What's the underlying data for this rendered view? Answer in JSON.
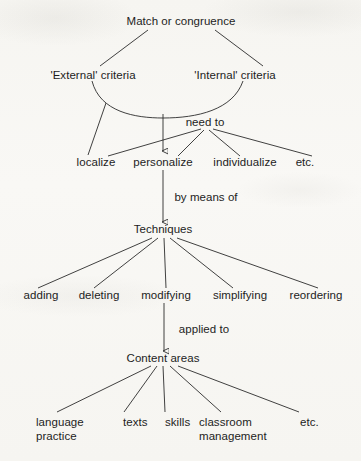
{
  "diagram": {
    "title": "Match or congruence",
    "type": "hierarchy-tree",
    "ink_color": "#2b2b2b",
    "paper_color": "#f6f5f1",
    "levels": [
      {
        "level": 1,
        "name": "root",
        "nodes": [
          {
            "id": "root",
            "label": "Match or congruence",
            "x": 181,
            "y": 22
          }
        ]
      },
      {
        "level": 2,
        "name": "criteria",
        "nodes": [
          {
            "id": "external",
            "label": "'External' criteria",
            "x": 93,
            "y": 76
          },
          {
            "id": "internal",
            "label": "'Internal' criteria",
            "x": 235,
            "y": 76
          }
        ]
      },
      {
        "level": 3,
        "name": "connector-need-to",
        "nodes": [
          {
            "id": "needto",
            "label": "need to",
            "x": 205,
            "y": 123
          }
        ]
      },
      {
        "level": 4,
        "name": "actions",
        "nodes": [
          {
            "id": "localize",
            "label": "localize",
            "x": 96,
            "y": 163
          },
          {
            "id": "personalize",
            "label": "personalize",
            "x": 163,
            "y": 163
          },
          {
            "id": "individualize",
            "label": "individualize",
            "x": 245,
            "y": 163
          },
          {
            "id": "etc-actions",
            "label": "etc.",
            "x": 305,
            "y": 163
          }
        ]
      },
      {
        "level": 5,
        "name": "connector-by-means-of",
        "nodes": [
          {
            "id": "bymeansof",
            "label": "by means of",
            "x": 206,
            "y": 198
          }
        ]
      },
      {
        "level": 6,
        "name": "techniques",
        "nodes": [
          {
            "id": "techniques",
            "label": "Techniques",
            "x": 163,
            "y": 230
          }
        ]
      },
      {
        "level": 7,
        "name": "technique-items",
        "nodes": [
          {
            "id": "adding",
            "label": "adding",
            "x": 41,
            "y": 296
          },
          {
            "id": "deleting",
            "label": "deleting",
            "x": 99,
            "y": 296
          },
          {
            "id": "modifying",
            "label": "modifying",
            "x": 166,
            "y": 296
          },
          {
            "id": "simplifying",
            "label": "simplifying",
            "x": 240,
            "y": 296
          },
          {
            "id": "reordering",
            "label": "reordering",
            "x": 316,
            "y": 296
          }
        ]
      },
      {
        "level": 8,
        "name": "connector-applied-to",
        "nodes": [
          {
            "id": "appliedto",
            "label": "applied to",
            "x": 204,
            "y": 330
          }
        ]
      },
      {
        "level": 9,
        "name": "content-areas",
        "nodes": [
          {
            "id": "contentareas",
            "label": "Content areas",
            "x": 163,
            "y": 359
          }
        ]
      },
      {
        "level": 10,
        "name": "content-items",
        "nodes": [
          {
            "id": "language-practice",
            "label": "language\npractice",
            "line1": "language",
            "line2": "practice",
            "x": 36,
            "y": 422
          },
          {
            "id": "texts",
            "label": "texts",
            "x": 123,
            "y": 422
          },
          {
            "id": "skills",
            "label": "skills",
            "x": 165,
            "y": 422
          },
          {
            "id": "classroom-management",
            "label": "classroom\nmanagement",
            "line1": "classroom",
            "line2": "management",
            "x": 199,
            "y": 422
          },
          {
            "id": "etc-content",
            "label": "etc.",
            "x": 300,
            "y": 422
          }
        ]
      }
    ],
    "edges": [
      {
        "from": "root",
        "to": "external",
        "kind": "line"
      },
      {
        "from": "root",
        "to": "internal",
        "kind": "line"
      },
      {
        "from": "external",
        "to": "internal",
        "kind": "arc"
      },
      {
        "from": "arc",
        "to": "localize",
        "kind": "line"
      },
      {
        "from": "arc",
        "to": "personalize",
        "kind": "arrow"
      },
      {
        "from": "needto",
        "to": "localize",
        "kind": "line"
      },
      {
        "from": "needto",
        "to": "personalize",
        "kind": "line"
      },
      {
        "from": "needto",
        "to": "individualize",
        "kind": "line"
      },
      {
        "from": "needto",
        "to": "etc-actions",
        "kind": "line"
      },
      {
        "from": "personalize",
        "to": "techniques",
        "kind": "arrow"
      },
      {
        "from": "techniques",
        "to": "adding",
        "kind": "line"
      },
      {
        "from": "techniques",
        "to": "deleting",
        "kind": "line"
      },
      {
        "from": "techniques",
        "to": "modifying",
        "kind": "line"
      },
      {
        "from": "techniques",
        "to": "simplifying",
        "kind": "line"
      },
      {
        "from": "techniques",
        "to": "reordering",
        "kind": "line"
      },
      {
        "from": "modifying",
        "to": "contentareas",
        "kind": "arrow"
      },
      {
        "from": "contentareas",
        "to": "language-practice",
        "kind": "line"
      },
      {
        "from": "contentareas",
        "to": "texts",
        "kind": "line"
      },
      {
        "from": "contentareas",
        "to": "skills",
        "kind": "line"
      },
      {
        "from": "contentareas",
        "to": "classroom-management",
        "kind": "line"
      },
      {
        "from": "contentareas",
        "to": "etc-content",
        "kind": "line"
      }
    ]
  }
}
